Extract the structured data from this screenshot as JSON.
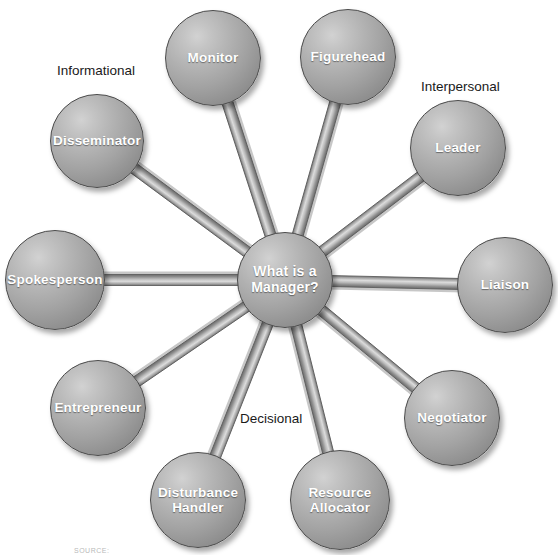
{
  "diagram": {
    "center": {
      "id": "center-node",
      "label": "What is a Manager?",
      "label_lines": [
        "What is a",
        "Manager?"
      ],
      "cx": 285,
      "cy": 280,
      "r": 48
    },
    "categories": [
      {
        "id": "informational",
        "label": "Informational",
        "x": 57,
        "y": 63
      },
      {
        "id": "interpersonal",
        "label": "Interpersonal",
        "x": 421,
        "y": 79
      },
      {
        "id": "decisional",
        "label": "Decisional",
        "x": 240,
        "y": 411
      }
    ],
    "roles": [
      {
        "id": "monitor",
        "label": "Monitor",
        "label_lines": [
          "Monitor"
        ],
        "category": "Informational",
        "cx": 213,
        "cy": 58,
        "r": 48
      },
      {
        "id": "figurehead",
        "label": "Figurehead",
        "label_lines": [
          "Figurehead"
        ],
        "category": "Interpersonal",
        "cx": 348,
        "cy": 57,
        "r": 48
      },
      {
        "id": "leader",
        "label": "Leader",
        "label_lines": [
          "Leader"
        ],
        "category": "Interpersonal",
        "cx": 458,
        "cy": 148,
        "r": 48
      },
      {
        "id": "liaison",
        "label": "Liaison",
        "label_lines": [
          "Liaison"
        ],
        "category": "Interpersonal",
        "cx": 505,
        "cy": 285,
        "r": 48
      },
      {
        "id": "negotiator",
        "label": "Negotiator",
        "label_lines": [
          "Negotiator"
        ],
        "category": "Decisional",
        "cx": 452,
        "cy": 418,
        "r": 48
      },
      {
        "id": "resource-allocator",
        "label": "Resource Allocator",
        "label_lines": [
          "Resource",
          "Allocator"
        ],
        "category": "Decisional",
        "cx": 340,
        "cy": 500,
        "r": 50
      },
      {
        "id": "disturbance-handler",
        "label": "Disturbance Handler",
        "label_lines": [
          "Disturbance",
          "Handler"
        ],
        "category": "Decisional",
        "cx": 198,
        "cy": 500,
        "r": 48
      },
      {
        "id": "entrepreneur",
        "label": "Entrepreneur",
        "label_lines": [
          "Entrepreneur"
        ],
        "category": "Decisional",
        "cx": 98,
        "cy": 408,
        "r": 48
      },
      {
        "id": "spokesperson",
        "label": "Spokesperson",
        "label_lines": [
          "Spokesperson"
        ],
        "category": "Informational",
        "cx": 55,
        "cy": 280,
        "r": 50
      },
      {
        "id": "disseminator",
        "label": "Disseminator",
        "label_lines": [
          "Disseminator"
        ],
        "category": "Informational",
        "cx": 97,
        "cy": 141,
        "r": 47
      }
    ],
    "connectors": [
      {
        "id": "rod-monitor",
        "from": "center-node",
        "to": "monitor",
        "width": 11
      },
      {
        "id": "rod-figurehead",
        "from": "center-node",
        "to": "figurehead",
        "width": 11
      },
      {
        "id": "rod-leader",
        "from": "center-node",
        "to": "leader",
        "width": 11
      },
      {
        "id": "rod-liaison",
        "from": "center-node",
        "to": "liaison",
        "width": 11
      },
      {
        "id": "rod-negotiator",
        "from": "center-node",
        "to": "negotiator",
        "width": 11
      },
      {
        "id": "rod-resource-allocator",
        "from": "center-node",
        "to": "resource-allocator",
        "width": 11
      },
      {
        "id": "rod-disturbance-handler",
        "from": "center-node",
        "to": "disturbance-handler",
        "width": 11
      },
      {
        "id": "rod-entrepreneur",
        "from": "center-node",
        "to": "entrepreneur",
        "width": 11
      },
      {
        "id": "rod-spokesperson",
        "from": "center-node",
        "to": "spokesperson",
        "width": 11
      },
      {
        "id": "rod-disseminator",
        "from": "center-node",
        "to": "disseminator",
        "width": 11
      }
    ],
    "source_credit": {
      "text": "SOURCE:",
      "x": 74,
      "y": 547
    },
    "colors": {
      "background": "#ffffff",
      "sphere_highlight": "#d2d2d2",
      "sphere_mid": "#a2a2a2",
      "sphere_edge": "#7c7c7c",
      "sphere_outline": "#4a4a4a",
      "rod_light": "#d8d8d8",
      "rod_mid": "#a8a8a8",
      "rod_dark": "#6f6f6f",
      "label_text": "#ffffff",
      "category_text": "#1a1a1a"
    }
  }
}
